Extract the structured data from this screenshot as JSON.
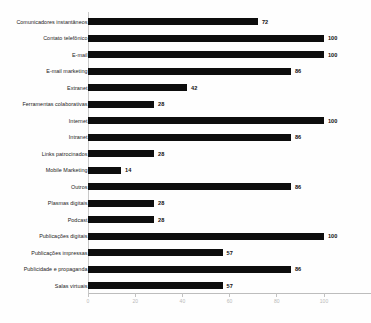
{
  "chart_data": {
    "type": "bar",
    "orientation": "horizontal",
    "title": "",
    "xlabel": "",
    "ylabel": "",
    "xlim": [
      0,
      120
    ],
    "xticks": [
      0,
      20,
      40,
      60,
      80,
      100,
      120
    ],
    "grid": false,
    "legend": "none",
    "bar_color": "#0d0d0d",
    "categories": [
      "Comunicadores instantâneos",
      "Contato telefônico",
      "E-mail",
      "E-mail marketing",
      "Extranet",
      "Ferramentas colaborativas",
      "Internet",
      "Intranet",
      "Links patrocinados",
      "Mobile Marketing",
      "Outros",
      "Plasmas digitais",
      "Podcast",
      "Publicações digitais",
      "Publicações impressas",
      "Publicidade e propaganda",
      "Salas virtuais"
    ],
    "values": [
      72,
      100,
      100,
      86,
      42,
      28,
      100,
      86,
      28,
      14,
      86,
      28,
      28,
      100,
      57,
      86,
      57
    ],
    "value_labels": [
      "72",
      "100",
      "100",
      "86",
      "42",
      "28",
      "100",
      "86",
      "28",
      "14",
      "86",
      "28",
      "28",
      "100",
      "57",
      "86",
      "57"
    ],
    "xtick_labels": [
      "0",
      "20",
      "40",
      "60",
      "80",
      "100",
      "120"
    ]
  }
}
